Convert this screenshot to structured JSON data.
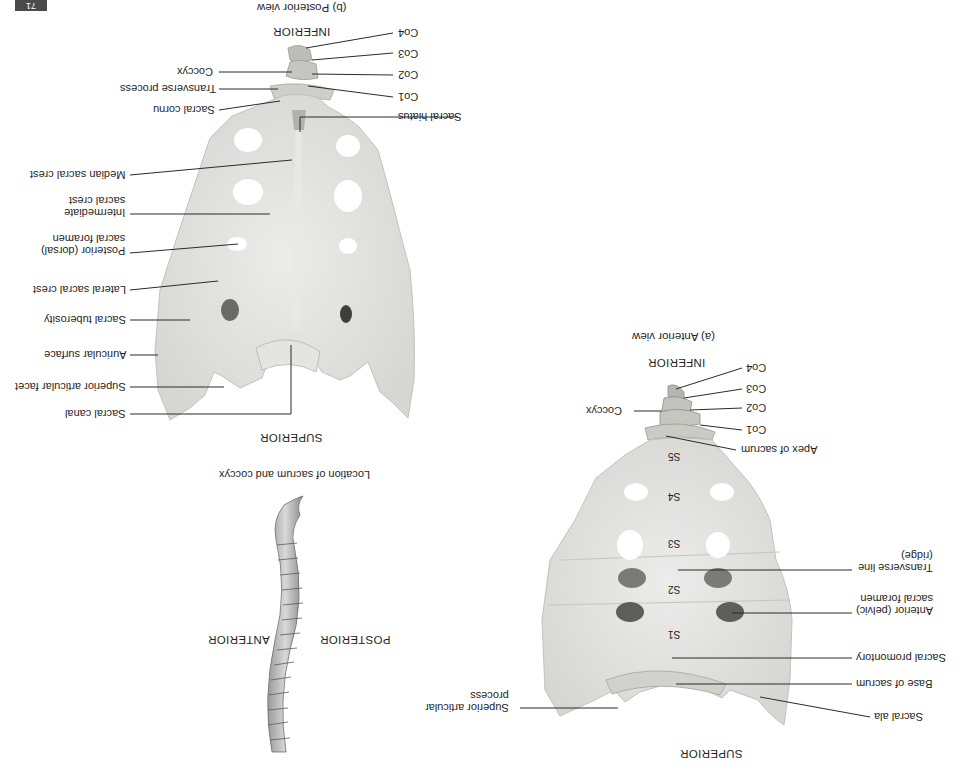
{
  "page": {
    "orientation": "rotated 180 degrees",
    "badge": "71"
  },
  "panel_b": {
    "title": "(b) Posterior view",
    "top_orientation": "INFERIOR",
    "bottom_orientation": "SUPERIOR",
    "labels_left": [
      {
        "text": "Coccyx"
      },
      {
        "text": "Transverse process"
      },
      {
        "text": "Sacral cornu"
      },
      {
        "text": "Median sacral crest"
      },
      {
        "text": "Intermediate\nsacral crest"
      },
      {
        "text": "Posterior (dorsal)\nsacral foramen"
      },
      {
        "text": "Lateral sacral crest"
      },
      {
        "text": "Sacral tuberosity"
      },
      {
        "text": "Auricular surface"
      },
      {
        "text": "Superior articular facet"
      },
      {
        "text": "Sacral canal"
      }
    ],
    "labels_right": [
      {
        "text": "Co4"
      },
      {
        "text": "Co3"
      },
      {
        "text": "Co2"
      },
      {
        "text": "Co1"
      },
      {
        "text": "Sacral hiatus"
      }
    ]
  },
  "location_inset": {
    "title": "Location of sacrum and coccyx",
    "left_label": "ANTERIOR",
    "right_label": "POSTERIOR"
  },
  "panel_a": {
    "title": "(a) Anterior view",
    "top_orientation": "INFERIOR",
    "bottom_orientation": "SUPERIOR",
    "segment_labels": [
      "S5",
      "S4",
      "S3",
      "S2",
      "S1"
    ],
    "labels_left": [
      {
        "text": "Coccyx"
      },
      {
        "text": "Superior articular\nprocess"
      }
    ],
    "labels_right": [
      {
        "text": "Co4"
      },
      {
        "text": "Co3"
      },
      {
        "text": "Co2"
      },
      {
        "text": "Co1"
      },
      {
        "text": "Apex of sacrum"
      },
      {
        "text": "Transverse line\n(ridge)"
      },
      {
        "text": "Anterior (pelvic)\nsacral foramen"
      },
      {
        "text": "Sacral promontory"
      },
      {
        "text": "Base of sacrum"
      },
      {
        "text": "Sacral ala"
      }
    ]
  }
}
